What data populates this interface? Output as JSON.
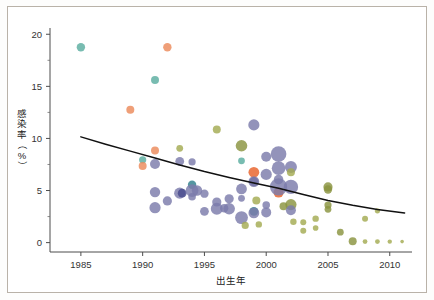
{
  "figure": {
    "border_color": "#b9b2a8",
    "background": "#ffffff"
  },
  "chart_data": {
    "type": "scatter",
    "title": "",
    "subtitle": "",
    "xlabel": "出生年",
    "ylabel": "感染率（%）",
    "ylabel_chars": [
      "感",
      "染",
      "率",
      "（",
      "%",
      "）"
    ],
    "xlim": [
      1982.5,
      2011.8
    ],
    "ylim": [
      -0.9,
      20.6
    ],
    "xticks": [
      1985,
      1990,
      1995,
      2000,
      2005,
      2010
    ],
    "xtick_labels": [
      "1985",
      "1990",
      "1995",
      "2000",
      "2005",
      "2010"
    ],
    "yticks": [
      0,
      5,
      10,
      15,
      20
    ],
    "ytick_labels": [
      "0",
      "5",
      "10",
      "15",
      "20"
    ],
    "y_minor_ticks": [
      2.5,
      7.5,
      12.5,
      17.5
    ],
    "grid": false,
    "legend": "none",
    "marker_encoding": "bubble size proportional to sample size; color denotes study group",
    "colors": {
      "purple": "#7b7bab",
      "purple_dark": "#484a8c",
      "orange": "#e8622a",
      "orange_light": "#ec8a5a",
      "teal": "#5aada0",
      "teal_dark": "#2f7f8c",
      "olive": "#8a9440",
      "olive_light": "#a3ab52",
      "line": "#111111"
    },
    "trend_line": {
      "label": "fitted decline curve",
      "points": [
        [
          1985.0,
          10.15
        ],
        [
          1987.0,
          9.45
        ],
        [
          1989.0,
          8.78
        ],
        [
          1991.0,
          8.12
        ],
        [
          1993.0,
          7.45
        ],
        [
          1995.0,
          6.82
        ],
        [
          1997.0,
          6.25
        ],
        [
          1999.0,
          5.72
        ],
        [
          2001.0,
          5.22
        ],
        [
          2003.0,
          4.62
        ],
        [
          2005.0,
          4.05
        ],
        [
          2007.0,
          3.58
        ],
        [
          2009.0,
          3.18
        ],
        [
          2011.2,
          2.85
        ]
      ]
    },
    "points": [
      {
        "x": 1985.0,
        "y": 18.75,
        "s": 4.2,
        "c": "teal"
      },
      {
        "x": 1992.0,
        "y": 18.75,
        "s": 4.2,
        "c": "orange_light"
      },
      {
        "x": 1991.0,
        "y": 15.6,
        "s": 4.0,
        "c": "teal"
      },
      {
        "x": 1989.0,
        "y": 12.75,
        "s": 4.0,
        "c": "orange_light"
      },
      {
        "x": 1991.0,
        "y": 8.85,
        "s": 4.0,
        "c": "orange_light"
      },
      {
        "x": 1990.0,
        "y": 7.95,
        "s": 3.6,
        "c": "teal"
      },
      {
        "x": 1990.0,
        "y": 7.35,
        "s": 4.0,
        "c": "orange_light"
      },
      {
        "x": 1991.0,
        "y": 7.55,
        "s": 5.0,
        "c": "purple"
      },
      {
        "x": 1991.0,
        "y": 4.85,
        "s": 5.2,
        "c": "purple"
      },
      {
        "x": 1991.0,
        "y": 3.35,
        "s": 5.6,
        "c": "purple"
      },
      {
        "x": 1992.0,
        "y": 4.0,
        "s": 4.6,
        "c": "purple"
      },
      {
        "x": 1993.0,
        "y": 9.05,
        "s": 3.4,
        "c": "olive_light"
      },
      {
        "x": 1993.0,
        "y": 7.8,
        "s": 4.4,
        "c": "purple"
      },
      {
        "x": 1994.0,
        "y": 7.75,
        "s": 3.6,
        "c": "purple"
      },
      {
        "x": 1993.0,
        "y": 4.75,
        "s": 5.6,
        "c": "purple"
      },
      {
        "x": 1993.2,
        "y": 4.75,
        "s": 4.4,
        "c": "purple_dark"
      },
      {
        "x": 1994.0,
        "y": 5.55,
        "s": 4.2,
        "c": "teal_dark"
      },
      {
        "x": 1994.0,
        "y": 5.0,
        "s": 6.4,
        "c": "purple"
      },
      {
        "x": 1994.4,
        "y": 5.0,
        "s": 5.2,
        "c": "purple"
      },
      {
        "x": 1994.0,
        "y": 4.4,
        "s": 3.8,
        "c": "purple"
      },
      {
        "x": 1995.0,
        "y": 4.7,
        "s": 4.2,
        "c": "purple"
      },
      {
        "x": 1995.0,
        "y": 3.0,
        "s": 4.4,
        "c": "purple"
      },
      {
        "x": 1996.0,
        "y": 10.85,
        "s": 4.0,
        "c": "olive_light"
      },
      {
        "x": 1996.0,
        "y": 3.9,
        "s": 4.6,
        "c": "purple"
      },
      {
        "x": 1996.0,
        "y": 3.25,
        "s": 6.0,
        "c": "purple"
      },
      {
        "x": 1996.6,
        "y": 3.3,
        "s": 4.2,
        "c": "purple"
      },
      {
        "x": 1997.0,
        "y": 4.2,
        "s": 4.6,
        "c": "purple"
      },
      {
        "x": 1997.0,
        "y": 3.25,
        "s": 5.8,
        "c": "purple"
      },
      {
        "x": 1998.0,
        "y": 9.3,
        "s": 5.8,
        "c": "olive"
      },
      {
        "x": 1998.0,
        "y": 7.85,
        "s": 3.4,
        "c": "teal"
      },
      {
        "x": 1998.0,
        "y": 5.15,
        "s": 5.4,
        "c": "purple"
      },
      {
        "x": 1998.0,
        "y": 4.25,
        "s": 3.4,
        "c": "purple"
      },
      {
        "x": 1998.0,
        "y": 2.4,
        "s": 6.4,
        "c": "purple"
      },
      {
        "x": 1998.3,
        "y": 1.65,
        "s": 3.6,
        "c": "olive_light"
      },
      {
        "x": 1999.0,
        "y": 11.3,
        "s": 5.6,
        "c": "purple"
      },
      {
        "x": 1999.0,
        "y": 6.75,
        "s": 5.4,
        "c": "orange"
      },
      {
        "x": 1999.0,
        "y": 5.85,
        "s": 4.6,
        "c": "purple_dark"
      },
      {
        "x": 1999.0,
        "y": 5.85,
        "s": 5.4,
        "c": "purple"
      },
      {
        "x": 1999.2,
        "y": 4.05,
        "s": 4.0,
        "c": "olive_light"
      },
      {
        "x": 1999.0,
        "y": 3.0,
        "s": 4.4,
        "c": "teal_dark"
      },
      {
        "x": 1999.0,
        "y": 2.85,
        "s": 5.4,
        "c": "purple"
      },
      {
        "x": 1999.4,
        "y": 1.75,
        "s": 3.2,
        "c": "olive_light"
      },
      {
        "x": 2000.0,
        "y": 8.25,
        "s": 5.0,
        "c": "purple"
      },
      {
        "x": 2000.0,
        "y": 6.55,
        "s": 5.6,
        "c": "purple"
      },
      {
        "x": 2000.0,
        "y": 3.6,
        "s": 3.8,
        "c": "purple"
      },
      {
        "x": 2000.0,
        "y": 2.9,
        "s": 5.0,
        "c": "purple"
      },
      {
        "x": 2001.0,
        "y": 8.5,
        "s": 7.8,
        "c": "purple"
      },
      {
        "x": 2001.0,
        "y": 7.15,
        "s": 6.8,
        "c": "purple"
      },
      {
        "x": 2001.0,
        "y": 6.05,
        "s": 4.8,
        "c": "purple"
      },
      {
        "x": 2001.0,
        "y": 4.8,
        "s": 5.0,
        "c": "orange"
      },
      {
        "x": 2001.0,
        "y": 5.35,
        "s": 8.6,
        "c": "purple"
      },
      {
        "x": 2001.4,
        "y": 3.5,
        "s": 4.0,
        "c": "olive"
      },
      {
        "x": 2002.0,
        "y": 7.25,
        "s": 6.0,
        "c": "purple"
      },
      {
        "x": 2002.0,
        "y": 6.75,
        "s": 4.0,
        "c": "olive_light"
      },
      {
        "x": 2002.0,
        "y": 5.35,
        "s": 7.2,
        "c": "purple"
      },
      {
        "x": 2002.0,
        "y": 3.65,
        "s": 5.6,
        "c": "olive"
      },
      {
        "x": 2002.0,
        "y": 3.1,
        "s": 5.0,
        "c": "purple"
      },
      {
        "x": 2002.2,
        "y": 2.0,
        "s": 3.2,
        "c": "olive_light"
      },
      {
        "x": 2003.0,
        "y": 1.95,
        "s": 3.0,
        "c": "olive_light"
      },
      {
        "x": 2003.0,
        "y": 1.15,
        "s": 3.0,
        "c": "olive_light"
      },
      {
        "x": 2004.0,
        "y": 2.3,
        "s": 3.2,
        "c": "olive_light"
      },
      {
        "x": 2004.0,
        "y": 1.4,
        "s": 2.8,
        "c": "olive_light"
      },
      {
        "x": 2005.0,
        "y": 5.35,
        "s": 4.6,
        "c": "olive"
      },
      {
        "x": 2005.0,
        "y": 5.1,
        "s": 4.2,
        "c": "olive"
      },
      {
        "x": 2005.0,
        "y": 3.6,
        "s": 3.6,
        "c": "olive"
      },
      {
        "x": 2005.0,
        "y": 3.2,
        "s": 3.4,
        "c": "olive"
      },
      {
        "x": 2006.0,
        "y": 1.0,
        "s": 3.4,
        "c": "olive"
      },
      {
        "x": 2007.0,
        "y": 0.12,
        "s": 4.0,
        "c": "olive"
      },
      {
        "x": 2008.0,
        "y": 2.3,
        "s": 3.0,
        "c": "olive_light"
      },
      {
        "x": 2008.0,
        "y": 0.1,
        "s": 2.4,
        "c": "olive_light"
      },
      {
        "x": 2009.0,
        "y": 3.05,
        "s": 2.6,
        "c": "olive_light"
      },
      {
        "x": 2009.0,
        "y": 0.1,
        "s": 2.4,
        "c": "olive_light"
      },
      {
        "x": 2010.0,
        "y": 0.1,
        "s": 2.2,
        "c": "olive_light"
      },
      {
        "x": 2011.0,
        "y": 0.1,
        "s": 1.8,
        "c": "olive_light"
      }
    ]
  }
}
